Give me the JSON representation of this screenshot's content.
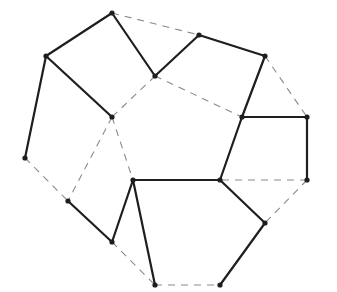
{
  "diagram": {
    "type": "planar-graph",
    "colors": {
      "solid": "#1e1e1e",
      "dashed": "#8a8a8a",
      "vertex": "#1e1e1e",
      "background": "#ffffff"
    },
    "vertices": [
      {
        "id": "A",
        "x": 112,
        "y": 13
      },
      {
        "id": "B",
        "x": 46,
        "y": 56
      },
      {
        "id": "C",
        "x": 25,
        "y": 158
      },
      {
        "id": "D",
        "x": 112,
        "y": 117
      },
      {
        "id": "E",
        "x": 155,
        "y": 76
      },
      {
        "id": "F",
        "x": 199,
        "y": 35
      },
      {
        "id": "G",
        "x": 265,
        "y": 56
      },
      {
        "id": "H",
        "x": 242,
        "y": 117
      },
      {
        "id": "I",
        "x": 307,
        "y": 117
      },
      {
        "id": "J",
        "x": 307,
        "y": 180
      },
      {
        "id": "K",
        "x": 220,
        "y": 180
      },
      {
        "id": "L",
        "x": 265,
        "y": 223
      },
      {
        "id": "M",
        "x": 220,
        "y": 285
      },
      {
        "id": "N",
        "x": 155,
        "y": 285
      },
      {
        "id": "O",
        "x": 133,
        "y": 180
      },
      {
        "id": "P",
        "x": 112,
        "y": 242
      },
      {
        "id": "Q",
        "x": 68,
        "y": 201
      }
    ],
    "solid_edges": [
      [
        "A",
        "B"
      ],
      [
        "B",
        "C"
      ],
      [
        "B",
        "D"
      ],
      [
        "A",
        "E"
      ],
      [
        "E",
        "F"
      ],
      [
        "F",
        "G"
      ],
      [
        "G",
        "H"
      ],
      [
        "H",
        "K"
      ],
      [
        "H",
        "I"
      ],
      [
        "I",
        "J"
      ],
      [
        "K",
        "O"
      ],
      [
        "K",
        "L"
      ],
      [
        "L",
        "M"
      ],
      [
        "O",
        "N"
      ],
      [
        "O",
        "P"
      ],
      [
        "P",
        "Q"
      ]
    ],
    "dashed_edges": [
      [
        "A",
        "F"
      ],
      [
        "G",
        "I"
      ],
      [
        "E",
        "D"
      ],
      [
        "E",
        "H"
      ],
      [
        "D",
        "Q"
      ],
      [
        "D",
        "O"
      ],
      [
        "C",
        "Q"
      ],
      [
        "P",
        "N"
      ],
      [
        "N",
        "M"
      ],
      [
        "J",
        "K"
      ],
      [
        "J",
        "L"
      ]
    ]
  }
}
